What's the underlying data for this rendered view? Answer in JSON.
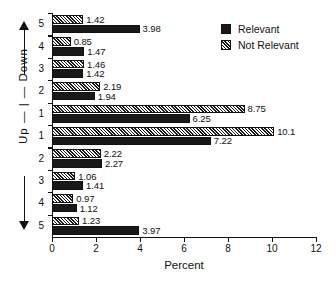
{
  "chart_data": {
    "type": "bar",
    "orientation": "horizontal",
    "title": "",
    "xlabel": "Percent",
    "ylabel": "Up — | — Down",
    "xlim": [
      0,
      12
    ],
    "xticks": [
      0,
      2,
      4,
      6,
      8,
      10,
      12
    ],
    "grid": false,
    "legend_position": "top-right",
    "categories": [
      "5",
      "4",
      "3",
      "2",
      "1",
      "1",
      "2",
      "3",
      "4",
      "5"
    ],
    "direction_groups": [
      {
        "label": "Up",
        "categories": [
          "5",
          "4",
          "3",
          "2",
          "1"
        ]
      },
      {
        "label": "Down",
        "categories": [
          "1",
          "2",
          "3",
          "4",
          "5"
        ]
      }
    ],
    "series": [
      {
        "name": "Not Relevant",
        "style": "hatched",
        "values": [
          1.42,
          0.85,
          1.46,
          2.19,
          8.75,
          10.1,
          2.22,
          1.06,
          0.97,
          1.23
        ],
        "labels": [
          "1.42",
          "0.85",
          "1.46",
          "2.19",
          "8.75",
          "10.1",
          "2.22",
          "1.06",
          "0.97",
          "1.23"
        ]
      },
      {
        "name": "Relevant",
        "style": "solid",
        "values": [
          3.98,
          1.47,
          1.42,
          1.94,
          6.25,
          7.22,
          2.27,
          1.41,
          1.12,
          3.97
        ],
        "labels": [
          "3.98",
          "1.47",
          "1.42",
          "1.94",
          "6.25",
          "7.22",
          "2.27",
          "1.41",
          "1.12",
          "3.97"
        ]
      }
    ]
  },
  "axis": {
    "x_title": "Percent",
    "x_tick_labels": [
      "0",
      "2",
      "4",
      "6",
      "8",
      "10",
      "12"
    ],
    "y_tick_labels": [
      "5",
      "4",
      "3",
      "2",
      "1",
      "1",
      "2",
      "3",
      "4",
      "5"
    ],
    "y_direction_text": "Up  —  |  —  Down",
    "y_up_label": "Up",
    "y_down_label": "Down"
  },
  "legend": {
    "items": [
      {
        "label": "Relevant",
        "style": "solid"
      },
      {
        "label": "Not Relevant",
        "style": "hatched"
      }
    ]
  },
  "colors": {
    "bar_fill": "#191919",
    "hatch_line": "#ffffff",
    "axis": "#111111",
    "background": "#ffffff"
  }
}
